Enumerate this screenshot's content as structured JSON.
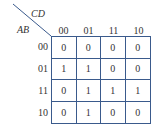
{
  "kmap": {
    "column_variable": "CD",
    "row_variable": "AB",
    "column_headers": [
      "00",
      "01",
      "11",
      "10"
    ],
    "row_headers": [
      "00",
      "01",
      "11",
      "10"
    ],
    "cells": [
      [
        "0",
        "0",
        "0",
        "0"
      ],
      [
        "1",
        "1",
        "0",
        "0"
      ],
      [
        "0",
        "1",
        "1",
        "1"
      ],
      [
        "0",
        "1",
        "0",
        "0"
      ]
    ],
    "line_color": "#3a5a8c"
  }
}
